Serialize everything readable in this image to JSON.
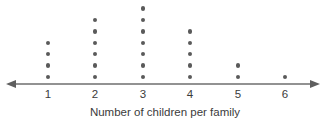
{
  "chart_data": {
    "type": "scatter",
    "plot_style": "dot-plot",
    "title": "",
    "subtitle": "",
    "xlabel": "Number of children per family",
    "ylabel": "",
    "categories": [
      "1",
      "2",
      "3",
      "4",
      "5",
      "6"
    ],
    "values": [
      4,
      6,
      7,
      5,
      2,
      1
    ],
    "x": [
      1,
      2,
      3,
      4,
      5,
      6
    ],
    "series": [
      {
        "name": "Frequency",
        "values": [
          4,
          6,
          7,
          5,
          2,
          1
        ]
      }
    ],
    "tick_labels": [
      "1",
      "2",
      "3",
      "4",
      "5",
      "6"
    ],
    "xlim": [
      0.3,
      6.7
    ],
    "ylim": [
      0,
      7
    ],
    "grid": false,
    "legend": false,
    "legend_position": "none",
    "annotations": [],
    "total_dots": 25,
    "marker": "filled-circle",
    "axis": {
      "arrow_left": true,
      "arrow_right": true,
      "line_color": "#6e6e6e"
    },
    "colors": {
      "dot": "#5a5a5a",
      "axis": "#6e6e6e",
      "text": "#3b3b3b",
      "background": "#ffffff"
    }
  },
  "geometry": {
    "axis_y": 84,
    "axis_x_start": 8,
    "axis_x_end": 318,
    "column_x": [
      48,
      95,
      143,
      190,
      238,
      285
    ],
    "dot_spacing": 11.4,
    "first_dot_offset": 7
  }
}
